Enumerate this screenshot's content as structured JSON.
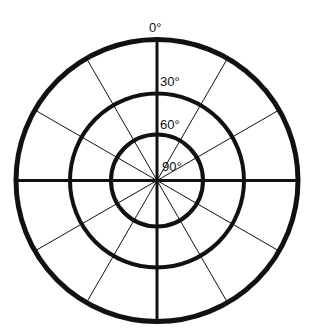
{
  "diagram": {
    "type": "polar-grid",
    "center": {
      "x": 157,
      "y": 180.5
    },
    "colors": {
      "background": "#ffffff",
      "stroke": "#111111"
    },
    "rings": [
      {
        "name": "outer-ring",
        "radius": 141,
        "stroke_width": 5,
        "angle_label": "0°"
      },
      {
        "name": "middle-ring",
        "radius": 87,
        "stroke_width": 4,
        "angle_label": "30°"
      },
      {
        "name": "inner-ring",
        "radius": 46,
        "stroke_width": 4,
        "angle_label": "60°"
      }
    ],
    "center_label": "90°",
    "axes": {
      "count": 2,
      "stroke_width": 3,
      "directions": [
        "vertical",
        "horizontal"
      ]
    },
    "spokes": {
      "count": 12,
      "increment_degrees": 30,
      "stroke_width": 1
    },
    "labels": {
      "zero": "0°",
      "thirty": "30°",
      "sixty": "60°",
      "ninety": "90°"
    }
  }
}
